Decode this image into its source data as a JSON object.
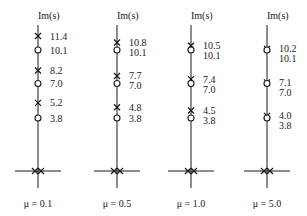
{
  "figure": {
    "type": "pole-zero diagram",
    "axis_label": "Im(s)",
    "colors": {
      "ink": "#1a1a1a",
      "background": "#ffffff"
    }
  },
  "chart_data": {
    "type": "scatter",
    "title": "",
    "ylabel": "Im(s)",
    "xlabel": "",
    "legend": {
      "x_marker": "pole",
      "o_marker": "zero"
    },
    "panels": [
      {
        "label": "μ = 0.1",
        "mu": 0.1,
        "poles_imag": [
          11.4,
          8.2,
          5.2
        ],
        "zeros_imag": [
          10.1,
          7.0,
          3.8
        ],
        "origin_poles": 2,
        "pole_labels": [
          "11.4",
          "8.2",
          "5.2"
        ],
        "zero_labels": [
          "10.1",
          "7.0",
          "3.8"
        ]
      },
      {
        "label": "μ = 0.5",
        "mu": 0.5,
        "poles_imag": [
          10.8,
          7.7,
          4.8
        ],
        "zeros_imag": [
          10.1,
          7.0,
          3.8
        ],
        "origin_poles": 2,
        "pole_labels": [
          "10.8",
          "7.7",
          "4.8"
        ],
        "zero_labels": [
          "10.1",
          "7.0",
          "3.8"
        ]
      },
      {
        "label": "μ = 1.0",
        "mu": 1.0,
        "poles_imag": [
          10.5,
          7.4,
          4.5
        ],
        "zeros_imag": [
          10.1,
          7.0,
          3.8
        ],
        "origin_poles": 2,
        "pole_labels": [
          "10.5",
          "7.4",
          "4.5"
        ],
        "zero_labels": [
          "10.1",
          "7.0",
          "3.8"
        ]
      },
      {
        "label": "μ = 5.0",
        "mu": 5.0,
        "poles_imag": [
          10.2,
          7.1,
          4.0
        ],
        "zeros_imag": [
          10.1,
          7.0,
          3.8
        ],
        "origin_poles": 2,
        "pole_labels": [
          "10.2",
          "7.1",
          "4.0"
        ],
        "zero_labels": [
          "10.1",
          "7.0",
          "3.8"
        ]
      }
    ]
  }
}
